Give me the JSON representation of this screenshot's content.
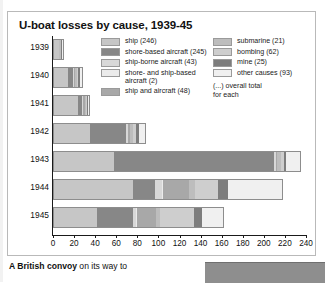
{
  "panel": {
    "title": "U-boat losses by cause, 1939-45"
  },
  "legend": {
    "note": "(...) overall total\nfor each",
    "left_column": [
      {
        "label": "ship (246)",
        "color": "#c6c6c6",
        "key": "ship"
      },
      {
        "label": "shore-based aircraft (245)",
        "color": "#878787",
        "key": "shore-based-aircraft"
      },
      {
        "label": "ship-borne aircraft (43)",
        "color": "#d8d8d8",
        "key": "ship-borne-aircraft"
      },
      {
        "label": "shore- and ship-based\naircraft (2)",
        "color": "#ebebeb",
        "key": "shore-and-ship-based-aircraft"
      },
      {
        "label": "ship and aircraft (48)",
        "color": "#a8a8a8",
        "key": "ship-and-aircraft"
      }
    ],
    "right_column": [
      {
        "label": "submarine (21)",
        "color": "#bdbdbd",
        "key": "submarine"
      },
      {
        "label": "bombing (62)",
        "color": "#cecece",
        "key": "bombing"
      },
      {
        "label": "mine (25)",
        "color": "#7d7d7d",
        "key": "mine"
      },
      {
        "label": "other causes (93)",
        "color": "#f0f0f0",
        "key": "other-causes"
      }
    ]
  },
  "caption": {
    "lead": "A British convoy",
    "rest": " on its way to"
  },
  "chart_data": {
    "type": "bar",
    "orientation": "horizontal",
    "stacked": true,
    "title": "U-boat losses by cause, 1939-45",
    "xlabel": "",
    "ylabel": "",
    "xlim": [
      0,
      240
    ],
    "x_ticks": [
      0,
      20,
      40,
      60,
      80,
      100,
      120,
      140,
      160,
      180,
      200,
      220,
      240
    ],
    "grid": false,
    "legend_position": "top-right",
    "categories": [
      "1939",
      "1940",
      "1941",
      "1942",
      "1943",
      "1944",
      "1945"
    ],
    "series": [
      {
        "name": "ship (246)",
        "color": "#c6c6c6",
        "values": [
          5,
          13,
          23,
          34,
          57,
          75,
          41
        ]
      },
      {
        "name": "shore-based aircraft (245)",
        "color": "#878787",
        "values": [
          0,
          5,
          4,
          34,
          152,
          21,
          34
        ]
      },
      {
        "name": "ship-borne aircraft (43)",
        "color": "#d8d8d8",
        "values": [
          0,
          1,
          1,
          2,
          2,
          6,
          3
        ]
      },
      {
        "name": "shore- and ship-based aircraft (2)",
        "color": "#ebebeb",
        "values": [
          0,
          0,
          0,
          0,
          0,
          1,
          1
        ]
      },
      {
        "name": "ship and aircraft (48)",
        "color": "#a8a8a8",
        "values": [
          0,
          1,
          1,
          2,
          1,
          25,
          18
        ]
      },
      {
        "name": "submarine (21)",
        "color": "#bdbdbd",
        "values": [
          2,
          2,
          1,
          3,
          3,
          6,
          4
        ]
      },
      {
        "name": "bombing (62)",
        "color": "#cecece",
        "values": [
          0,
          1,
          1,
          3,
          3,
          22,
          32
        ]
      },
      {
        "name": "mine (25)",
        "color": "#7d7d7d",
        "values": [
          1,
          2,
          1,
          3,
          2,
          9,
          7
        ]
      },
      {
        "name": "other causes (93)",
        "color": "#f0f0f0",
        "values": [
          1,
          2,
          1,
          5,
          13,
          51,
          20
        ]
      }
    ],
    "totals": [
      9,
      27,
      33,
      86,
      233,
      216,
      160
    ],
    "category_totals": {
      "ship": 246,
      "shore-based aircraft": 245,
      "ship-borne aircraft": 43,
      "shore- and ship-based aircraft": 2,
      "ship and aircraft": 48,
      "submarine": 21,
      "bombing": 62,
      "mine": 25,
      "other causes": 93
    }
  }
}
